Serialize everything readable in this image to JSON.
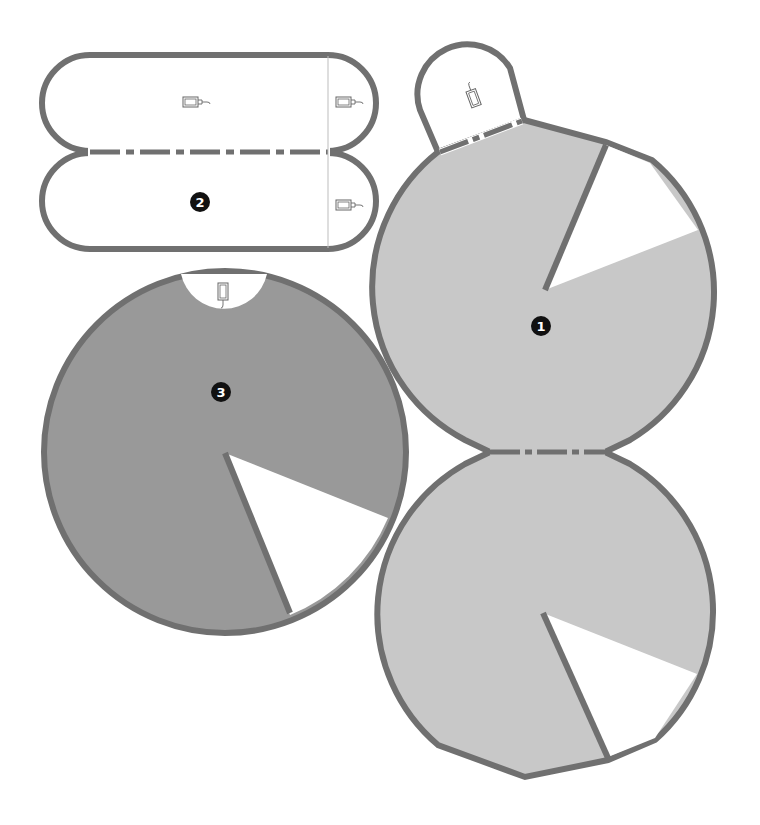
{
  "diagram": {
    "type": "papercraft-template",
    "colors": {
      "outline": "#707070",
      "light_fill": "#c8c8c8",
      "dark_fill": "#999999",
      "paper": "#ffffff",
      "badge": "#111111"
    },
    "pieces": [
      {
        "id": "piece-1",
        "label": "1",
        "shape": "circle with tab and wedge cutout",
        "fill": "light"
      },
      {
        "id": "piece-1-copy",
        "label": "",
        "shape": "circle with wedge cutout joined by fold line",
        "fill": "light"
      },
      {
        "id": "piece-2",
        "label": "2",
        "shape": "two stadium strips joined by fold line",
        "fill": "none"
      },
      {
        "id": "piece-3",
        "label": "3",
        "shape": "circle with top notch and wedge cutout",
        "fill": "dark"
      }
    ],
    "icons": [
      {
        "name": "outlet-plug-icon",
        "count": 5
      }
    ],
    "fold_line_style": "dash-dot"
  }
}
